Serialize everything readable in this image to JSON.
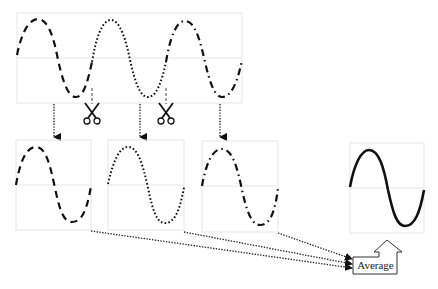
{
  "diagram": {
    "top_signal": {
      "segments": [
        "dashed",
        "dotted",
        "dash-dot"
      ]
    },
    "cut_icons": [
      "scissors-icon",
      "scissors-icon"
    ],
    "segments": [
      {
        "style": "dashed"
      },
      {
        "style": "dotted"
      },
      {
        "style": "dash-dot"
      }
    ],
    "result": {
      "style": "solid"
    },
    "average_label": "Average",
    "colors": {
      "stroke": "#111111",
      "frame": "#e6e6e6",
      "background": "#ffffff"
    }
  }
}
